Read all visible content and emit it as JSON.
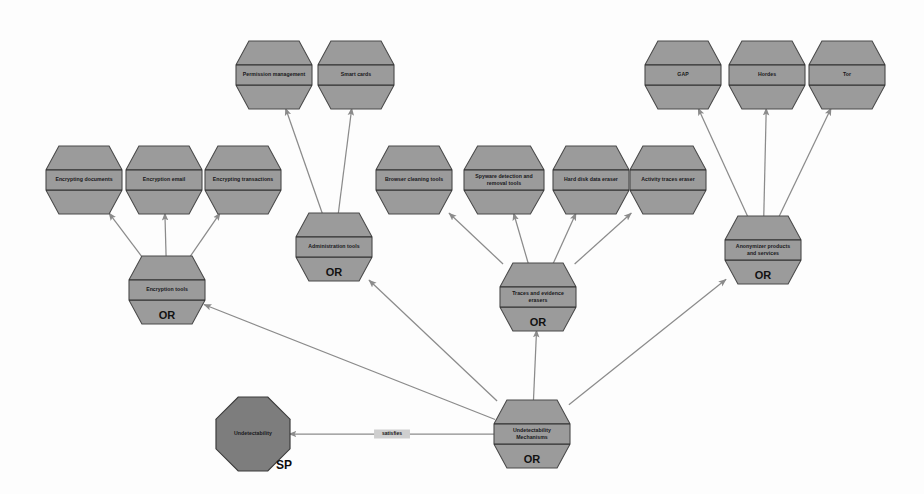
{
  "diagram": {
    "type": "goal-decomposition-model",
    "background_color": "#fdfdfd",
    "node_fill_color": "#9b9b9b",
    "softgoal_fill_color": "#7d7d7d",
    "node_stroke_color": "#4a4a4a",
    "edge_color": "#8b8b8b"
  },
  "nodes": [
    {
      "id": "encrypting-documents",
      "label": "Encrypting documents",
      "shape": "hexagon",
      "decomposition": "",
      "x": 84,
      "y": 180,
      "w": 76,
      "h": 68,
      "lines": [
        "Encrypting documents"
      ]
    },
    {
      "id": "encryption-email",
      "label": "Encryption email",
      "shape": "hexagon",
      "decomposition": "",
      "x": 164,
      "y": 180,
      "w": 76,
      "h": 68,
      "lines": [
        "Encryption email"
      ]
    },
    {
      "id": "encrypting-transactions",
      "label": "Encrypting transactions",
      "shape": "hexagon",
      "decomposition": "",
      "x": 243,
      "y": 180,
      "w": 76,
      "h": 68,
      "lines": [
        "Encrypting transactions"
      ]
    },
    {
      "id": "permission-management",
      "label": "Permission management",
      "shape": "hexagon",
      "decomposition": "",
      "x": 274,
      "y": 75,
      "w": 76,
      "h": 68,
      "lines": [
        "Permission management"
      ]
    },
    {
      "id": "smart-cards",
      "label": "Smart cards",
      "shape": "hexagon",
      "decomposition": "",
      "x": 356,
      "y": 75,
      "w": 76,
      "h": 68,
      "lines": [
        "Smart cards"
      ]
    },
    {
      "id": "browser-cleaning-tools",
      "label": "Browser cleaning tools",
      "shape": "hexagon",
      "decomposition": "",
      "x": 414,
      "y": 180,
      "w": 76,
      "h": 68,
      "lines": [
        "Browser cleaning tools"
      ]
    },
    {
      "id": "spyware-detection-removal-tools",
      "label": "Spyware detection and removal tools",
      "shape": "hexagon",
      "decomposition": "",
      "x": 504,
      "y": 180,
      "w": 80,
      "h": 68,
      "lines": [
        "Spyware detection and",
        "removal tools"
      ]
    },
    {
      "id": "hard-disk-data-eraser",
      "label": "Hard disk data eraser",
      "shape": "hexagon",
      "decomposition": "",
      "x": 591,
      "y": 180,
      "w": 76,
      "h": 68,
      "lines": [
        "Hard disk data eraser"
      ]
    },
    {
      "id": "activity-traces-eraser",
      "label": "Activity traces eraser",
      "shape": "hexagon",
      "decomposition": "",
      "x": 668,
      "y": 180,
      "w": 76,
      "h": 68,
      "lines": [
        "Activity traces eraser"
      ]
    },
    {
      "id": "gap",
      "label": "GAP",
      "shape": "hexagon",
      "decomposition": "",
      "x": 683,
      "y": 75,
      "w": 76,
      "h": 68,
      "lines": [
        "GAP"
      ]
    },
    {
      "id": "hordes",
      "label": "Hordes",
      "shape": "hexagon",
      "decomposition": "",
      "x": 767,
      "y": 75,
      "w": 76,
      "h": 68,
      "lines": [
        "Hordes"
      ]
    },
    {
      "id": "tor",
      "label": "Tor",
      "shape": "hexagon",
      "decomposition": "",
      "x": 847,
      "y": 75,
      "w": 76,
      "h": 68,
      "lines": [
        "Tor"
      ]
    },
    {
      "id": "encryption-tools",
      "label": "Encryption tools",
      "shape": "hexagon",
      "decomposition": "OR",
      "x": 167,
      "y": 290,
      "w": 76,
      "h": 68,
      "lines": [
        "Encryption tools"
      ]
    },
    {
      "id": "administration-tools",
      "label": "Administration tools",
      "shape": "hexagon",
      "decomposition": "OR",
      "x": 334,
      "y": 247,
      "w": 76,
      "h": 68,
      "lines": [
        "Administration tools"
      ]
    },
    {
      "id": "traces-and-evidence-erasers",
      "label": "Traces and evidence erasers",
      "shape": "hexagon",
      "decomposition": "OR",
      "x": 538,
      "y": 297,
      "w": 76,
      "h": 68,
      "lines": [
        "Traces and evidence",
        "erasers"
      ]
    },
    {
      "id": "anonymizer-products-and-services",
      "label": "Anonymizer products and services",
      "shape": "hexagon",
      "decomposition": "OR",
      "x": 763,
      "y": 250,
      "w": 76,
      "h": 68,
      "lines": [
        "Anonymizer products",
        "and services"
      ]
    },
    {
      "id": "undetectability-mechanisms",
      "label": "Undetectability Mechanisms",
      "shape": "hexagon",
      "decomposition": "OR",
      "x": 532,
      "y": 434,
      "w": 76,
      "h": 68,
      "lines": [
        "Undetectability",
        "Mechanisms"
      ]
    },
    {
      "id": "undetectability",
      "label": "Undetectability",
      "shape": "octagon",
      "decomposition": "",
      "softgoal_mark": "SP",
      "x": 253,
      "y": 434,
      "w": 74,
      "h": 74,
      "lines": [
        "Undetectability"
      ]
    }
  ],
  "edges": [
    {
      "id": "e1",
      "from": "encryption-tools",
      "to": "encrypting-documents",
      "label": ""
    },
    {
      "id": "e2",
      "from": "encryption-tools",
      "to": "encryption-email",
      "label": ""
    },
    {
      "id": "e3",
      "from": "encryption-tools",
      "to": "encrypting-transactions",
      "label": ""
    },
    {
      "id": "e4",
      "from": "administration-tools",
      "to": "permission-management",
      "label": ""
    },
    {
      "id": "e5",
      "from": "administration-tools",
      "to": "smart-cards",
      "label": ""
    },
    {
      "id": "e6",
      "from": "traces-and-evidence-erasers",
      "to": "browser-cleaning-tools",
      "label": ""
    },
    {
      "id": "e7",
      "from": "traces-and-evidence-erasers",
      "to": "spyware-detection-removal-tools",
      "label": ""
    },
    {
      "id": "e8",
      "from": "traces-and-evidence-erasers",
      "to": "hard-disk-data-eraser",
      "label": ""
    },
    {
      "id": "e9",
      "from": "traces-and-evidence-erasers",
      "to": "activity-traces-eraser",
      "label": ""
    },
    {
      "id": "e10",
      "from": "anonymizer-products-and-services",
      "to": "gap",
      "label": ""
    },
    {
      "id": "e11",
      "from": "anonymizer-products-and-services",
      "to": "hordes",
      "label": ""
    },
    {
      "id": "e12",
      "from": "anonymizer-products-and-services",
      "to": "tor",
      "label": ""
    },
    {
      "id": "e13",
      "from": "undetectability-mechanisms",
      "to": "encryption-tools",
      "label": ""
    },
    {
      "id": "e14",
      "from": "undetectability-mechanisms",
      "to": "administration-tools",
      "label": ""
    },
    {
      "id": "e15",
      "from": "undetectability-mechanisms",
      "to": "traces-and-evidence-erasers",
      "label": ""
    },
    {
      "id": "e16",
      "from": "undetectability-mechanisms",
      "to": "anonymizer-products-and-services",
      "label": ""
    },
    {
      "id": "e17",
      "from": "undetectability-mechanisms",
      "to": "undetectability",
      "label": "satisfies"
    }
  ],
  "edge_labels": {
    "satisfies": "satisfies"
  },
  "decomposition_labels": {
    "or": "OR"
  }
}
